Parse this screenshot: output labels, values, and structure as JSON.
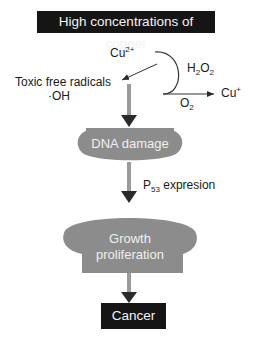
{
  "title": "High concentrations of copper",
  "nodes": {
    "cu2": {
      "base": "Cu",
      "sup": "2+"
    },
    "h2o2": {
      "a": "H",
      "sub1": "2",
      "b": "O",
      "sub2": "2"
    },
    "o2": {
      "base": "O",
      "sub": "2",
      "sup": "-"
    },
    "cu1": {
      "base": "Cu",
      "sup": "+"
    },
    "toxic_line1": "Toxic free radicals",
    "toxic_line2": "·OH",
    "dna_damage": "DNA damage",
    "p53": {
      "base": "P",
      "sub": "53",
      "rest": " expresion"
    },
    "growth_line1": "Growth",
    "growth_line2": "proliferation",
    "cancer": "Cancer"
  },
  "colors": {
    "box_dark": "#151515",
    "shape_gray": "#8c8c8c",
    "arrow": "#2a2a2a",
    "shaft_gray": "#9a9a9a"
  }
}
